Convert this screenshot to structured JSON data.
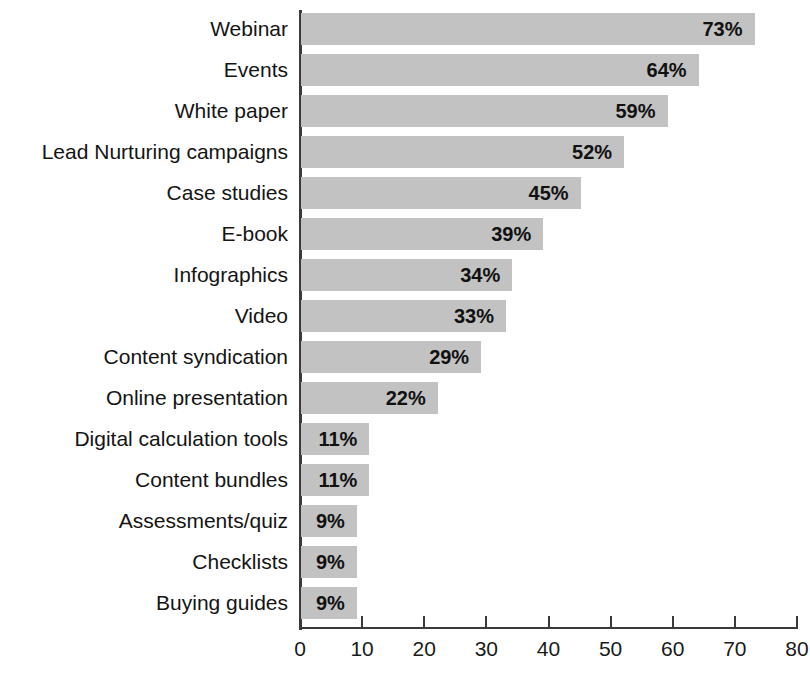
{
  "chart_data": {
    "type": "bar",
    "orientation": "horizontal",
    "title": "",
    "subtitle": "",
    "xlabel": "",
    "ylabel": "",
    "xlim": [
      0,
      80
    ],
    "grid": false,
    "legend": false,
    "value_suffix": "%",
    "bar_color": "#c2c2c2",
    "axis_color": "#3a3a3a",
    "categories": [
      "Webinar",
      "Events",
      "White paper",
      "Lead Nurturing campaigns",
      "Case studies",
      "E-book",
      "Infographics",
      "Video",
      "Content syndication",
      "Online presentation",
      "Digital calculation tools",
      "Content bundles",
      "Assessments/quiz",
      "Checklists",
      "Buying guides"
    ],
    "values": [
      73,
      64,
      59,
      52,
      45,
      39,
      34,
      33,
      29,
      22,
      11,
      11,
      9,
      9,
      9
    ],
    "value_labels": [
      "73%",
      "64%",
      "59%",
      "52%",
      "45%",
      "39%",
      "34%",
      "33%",
      "29%",
      "22%",
      "11%",
      "11%",
      "9%",
      "9%",
      "9%"
    ],
    "xticks": [
      0,
      10,
      20,
      30,
      40,
      50,
      60,
      70,
      80
    ],
    "xtick_labels": [
      "0",
      "10",
      "20",
      "30",
      "40",
      "50",
      "60",
      "70",
      "80"
    ]
  }
}
